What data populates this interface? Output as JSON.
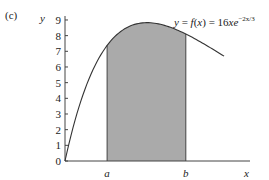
{
  "panel_label": "(c)",
  "chart_data": {
    "type": "area",
    "title": "",
    "function_label": "y = f(x) = 16xe",
    "function_exponent": "−2x/3",
    "function_expression": "f(x) = 16x e^(-2x/3)",
    "xlabel": "x",
    "ylabel": "y",
    "y_ticks": [
      0,
      1,
      2,
      3,
      4,
      5,
      6,
      7,
      8,
      9
    ],
    "ylim": [
      0,
      9
    ],
    "x_tick_labels": [
      "a",
      "b"
    ],
    "a_value": 0.77,
    "b_value": 2.21,
    "x_range": [
      0,
      2.91
    ],
    "shaded_region": {
      "from": "a",
      "to": "b",
      "color": "#aaaaaa"
    },
    "curve_points": [
      {
        "x": 0,
        "y": 0
      },
      {
        "x": 0.5,
        "y": 5.73
      },
      {
        "x": 0.77,
        "y": 7.38
      },
      {
        "x": 1.0,
        "y": 8.21
      },
      {
        "x": 1.5,
        "y": 8.83
      },
      {
        "x": 2.0,
        "y": 8.43
      },
      {
        "x": 2.21,
        "y": 8.09
      },
      {
        "x": 2.5,
        "y": 7.55
      },
      {
        "x": 2.91,
        "y": 6.68
      }
    ],
    "grid": false,
    "legend": null
  }
}
